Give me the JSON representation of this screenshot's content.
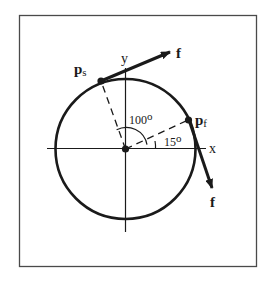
{
  "diagram": {
    "type": "circle-force-diagram",
    "axes": {
      "x_label": "x",
      "y_label": "y"
    },
    "points": {
      "start": {
        "label": "p",
        "subscript": "s",
        "angle_deg": 115
      },
      "finish": {
        "label": "p",
        "subscript": "f",
        "angle_deg": 15
      }
    },
    "forces": {
      "start_label": "f",
      "finish_label": "f"
    },
    "angles": {
      "sweep_label": "100o",
      "finish_label": "15o",
      "sweep_value": "100",
      "finish_value": "15",
      "degree_mark": "o"
    },
    "colors": {
      "stroke": "#1a1a1a",
      "frame": "#4a4a4a",
      "background": "#ffffff"
    }
  }
}
